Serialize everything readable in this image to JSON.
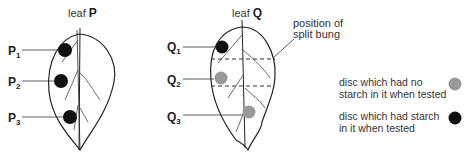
{
  "leaf_p": {
    "title_prefix": "leaf",
    "title_letter": "P",
    "discs": [
      {
        "label": "P",
        "sub": "1",
        "starch": true
      },
      {
        "label": "P",
        "sub": "2",
        "starch": true
      },
      {
        "label": "P",
        "sub": "3",
        "starch": true
      }
    ]
  },
  "leaf_q": {
    "title_prefix": "leaf",
    "title_letter": "Q",
    "discs": [
      {
        "label": "Q",
        "sub": "1",
        "starch": true
      },
      {
        "label": "Q",
        "sub": "2",
        "starch": false
      },
      {
        "label": "Q",
        "sub": "3",
        "starch": false
      }
    ],
    "annotation_line1": "position of",
    "annotation_line2": "split bung"
  },
  "legend": {
    "no_starch_line1": "disc which had no",
    "no_starch_line2": "starch in it when tested",
    "starch_line1": "disc which had starch",
    "starch_line2": "in it when tested"
  },
  "colors": {
    "starch": "#111111",
    "no_starch": "#9a9a9a"
  }
}
